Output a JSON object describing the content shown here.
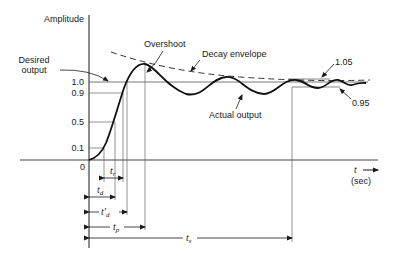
{
  "axes": {
    "y_label": "Amplitude",
    "x_label": "t",
    "x_unit": "(sec)",
    "origin_label": "0",
    "y_ticks": [
      "1.0",
      "0.9",
      "0.5",
      "0.1"
    ]
  },
  "annotations": {
    "desired_output_line1": "Desired",
    "desired_output_line2": "output",
    "overshoot": "Overshoot",
    "decay_envelope": "Decay envelope",
    "actual_output": "Actual output",
    "upper_band": "1.05",
    "lower_band": "0.95"
  },
  "time_intervals": {
    "rise_time": {
      "symbol": "t",
      "sub": "r"
    },
    "delay_time": {
      "symbol": "t",
      "sub": "d"
    },
    "delay_time_prime": {
      "symbol": "t′",
      "sub": "d"
    },
    "peak_time": {
      "symbol": "t",
      "sub": "p"
    },
    "settling_time": {
      "symbol": "t",
      "sub": "s"
    }
  },
  "colors": {
    "line": "#1a1a1a",
    "grid": "#555555"
  }
}
